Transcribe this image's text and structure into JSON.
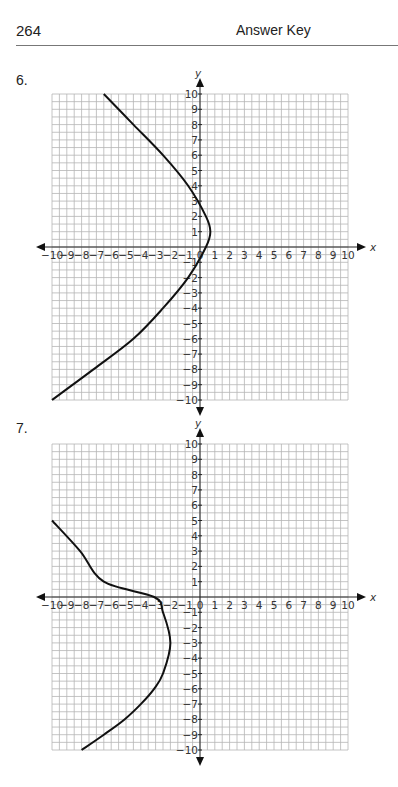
{
  "header": {
    "page_number": "264",
    "title": "Answer Key"
  },
  "problems": [
    {
      "number": "6."
    },
    {
      "number": "7."
    }
  ],
  "chart_data": [
    {
      "type": "line",
      "title": "6.",
      "xlabel": "x",
      "ylabel": "y",
      "xlim": [
        -10,
        10
      ],
      "ylim": [
        -10,
        10
      ],
      "grid": true,
      "grid_step": 0.5,
      "x_ticks": [
        -10,
        -9,
        -8,
        -7,
        -6,
        -5,
        -4,
        -3,
        -2,
        -1,
        0,
        1,
        2,
        3,
        4,
        5,
        6,
        7,
        8,
        9,
        10
      ],
      "y_ticks": [
        -10,
        -9,
        -8,
        -7,
        -6,
        -5,
        -4,
        -3,
        -2,
        -1,
        1,
        2,
        3,
        4,
        5,
        6,
        7,
        8,
        9,
        10
      ],
      "series": [
        {
          "name": "horizontal parabola opening left",
          "vertex": [
            0.7,
            1
          ],
          "points": [
            [
              -6.5,
              10
            ],
            [
              -4.5,
              8
            ],
            [
              -2.5,
              6
            ],
            [
              -0.8,
              4
            ],
            [
              0.4,
              2
            ],
            [
              0.7,
              1
            ],
            [
              0.4,
              0
            ],
            [
              -0.8,
              -2
            ],
            [
              -2.5,
              -4
            ],
            [
              -4.5,
              -6
            ],
            [
              -7.2,
              -8
            ],
            [
              -10,
              -10
            ]
          ]
        }
      ]
    },
    {
      "type": "line",
      "title": "7.",
      "xlabel": "x",
      "ylabel": "y",
      "xlim": [
        -10,
        10
      ],
      "ylim": [
        -10,
        10
      ],
      "grid": true,
      "grid_step": 0.5,
      "x_ticks": [
        -10,
        -9,
        -8,
        -7,
        -6,
        -5,
        -4,
        -3,
        -2,
        -1,
        0,
        1,
        2,
        3,
        4,
        5,
        6,
        7,
        8,
        9,
        10
      ],
      "y_ticks": [
        -10,
        -9,
        -8,
        -7,
        -6,
        -5,
        -4,
        -3,
        -2,
        -1,
        1,
        2,
        3,
        4,
        5,
        6,
        7,
        8,
        9,
        10
      ],
      "series": [
        {
          "name": "horizontal parabola opening left",
          "vertex": [
            -2,
            -3
          ],
          "points": [
            [
              -10,
              5
            ],
            [
              -8.1,
              3
            ],
            [
              -6.5,
              1
            ],
            [
              -3.1,
              0
            ],
            [
              -2.5,
              -1
            ],
            [
              -2,
              -3
            ],
            [
              -2.5,
              -5
            ],
            [
              -3.1,
              -6
            ],
            [
              -4,
              -7
            ],
            [
              -5.1,
              -8
            ],
            [
              -6.5,
              -9
            ],
            [
              -8,
              -10
            ]
          ]
        }
      ]
    }
  ]
}
